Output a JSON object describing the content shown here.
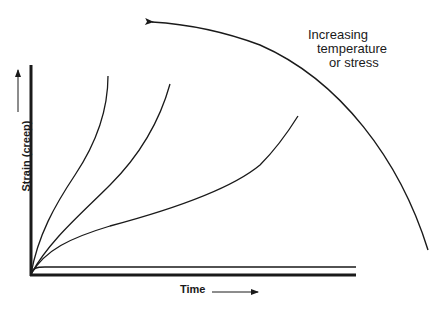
{
  "diagram": {
    "annotation": {
      "lines": [
        "Increasing",
        "temperature",
        "or stress"
      ]
    },
    "x_axis_label": "Time",
    "y_axis_label": "Strain (creep)",
    "curves": [
      {
        "name": "flat-curve",
        "description": "near-horizontal, low temperature/stress"
      },
      {
        "name": "curve-3",
        "description": "gradual rise ending at right"
      },
      {
        "name": "curve-2",
        "description": "medium rise, tertiary upturn"
      },
      {
        "name": "curve-1",
        "description": "steepest rise, earliest rupture"
      }
    ],
    "colors": {
      "ink": "#1a1a1a",
      "background": "#ffffff"
    }
  }
}
